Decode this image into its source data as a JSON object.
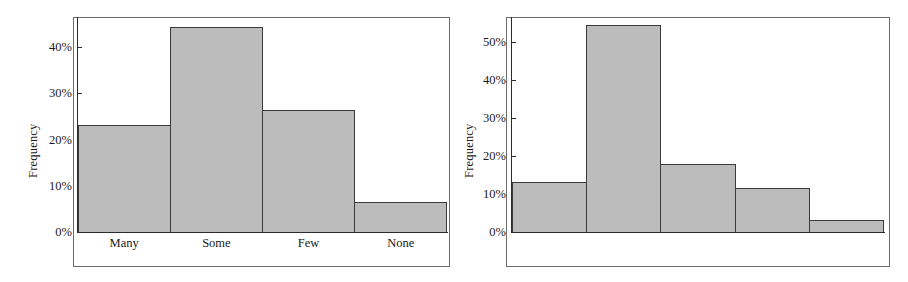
{
  "chart_data": [
    {
      "type": "bar",
      "id": "left",
      "title": "",
      "xlabel": "",
      "ylabel": "Frequency",
      "categories": [
        "Many",
        "Some",
        "Few",
        "None"
      ],
      "values": [
        23.2,
        44.3,
        26.3,
        6.5
      ],
      "ylim": [
        0,
        46.5
      ],
      "yticks": [
        0,
        10,
        20,
        30,
        40
      ],
      "ytick_labels": [
        "0%",
        "10%",
        "20%",
        "30%",
        "40%"
      ],
      "grid": false,
      "legend": "none",
      "bar_fill": "#bcbcbc",
      "bar_edge": "#3a3a3a"
    },
    {
      "type": "bar",
      "id": "right",
      "title": "",
      "xlabel": "",
      "ylabel": "Frequency",
      "categories": [
        "Very Easy",
        "Easy",
        "Neither",
        "Difficult",
        "Very Difficult"
      ],
      "values": [
        13.1,
        54.5,
        17.8,
        11.5,
        3.2
      ],
      "ylim": [
        0,
        56.5
      ],
      "yticks": [
        0,
        10,
        20,
        30,
        40,
        50
      ],
      "ytick_labels": [
        "0%",
        "10%",
        "20%",
        "30%",
        "40%",
        "50%"
      ],
      "grid": false,
      "legend": "none",
      "bar_fill": "#bcbcbc",
      "bar_edge": "#3a3a3a"
    }
  ],
  "colors": {
    "bar_fill": "#bcbcbc",
    "bar_edge": "#3a3a3a",
    "axis": "#2b2b2b",
    "frame": "#6b6b6b",
    "text": "#1a1a1a",
    "background": "#ffffff"
  }
}
